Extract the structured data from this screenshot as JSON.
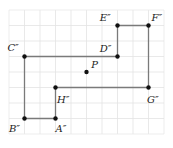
{
  "figure": {
    "type": "coordinate-grid-polygon",
    "grid": {
      "x0": 9,
      "y0": 10,
      "cell": 15.5,
      "cols": 10,
      "rows": 8,
      "line_color": "#e3e3e3",
      "border_color": "#e8e8e8"
    },
    "polygon": {
      "stroke": "#7a7a7a",
      "vertex_order": [
        "A''",
        "B''",
        "C''",
        "D''",
        "E''",
        "F''",
        "G''",
        "H''"
      ]
    },
    "points": [
      {
        "id": "A",
        "label": "A″",
        "gx": 3,
        "gy": 7,
        "lx": 3,
        "ly": 7.9,
        "anchor": "start"
      },
      {
        "id": "B",
        "label": "B″",
        "gx": 1,
        "gy": 7,
        "lx": 0.0,
        "ly": 7.9,
        "anchor": "start"
      },
      {
        "id": "C",
        "label": "C″",
        "gx": 1,
        "gy": 3,
        "lx": -0.1,
        "ly": 2.65,
        "anchor": "start"
      },
      {
        "id": "D",
        "label": "D″",
        "gx": 7,
        "gy": 3,
        "lx": 5.85,
        "ly": 2.7,
        "anchor": "start"
      },
      {
        "id": "E",
        "label": "E″",
        "gx": 7,
        "gy": 1,
        "lx": 5.85,
        "ly": 0.7,
        "anchor": "start"
      },
      {
        "id": "F",
        "label": "F″",
        "gx": 9,
        "gy": 1,
        "lx": 9.2,
        "ly": 0.7,
        "anchor": "start"
      },
      {
        "id": "G",
        "label": "G″",
        "gx": 9,
        "gy": 5,
        "lx": 8.9,
        "ly": 6.0,
        "anchor": "start"
      },
      {
        "id": "H",
        "label": "H″",
        "gx": 3,
        "gy": 5,
        "lx": 3.1,
        "ly": 6.0,
        "anchor": "start"
      }
    ],
    "center": {
      "id": "P",
      "label": "P",
      "gx": 5,
      "gy": 4,
      "lx": 5.3,
      "ly": 3.75
    }
  }
}
